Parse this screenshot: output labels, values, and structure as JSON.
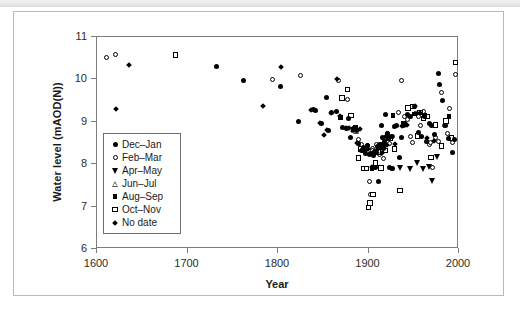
{
  "figure": {
    "frame_border_color": "#b9b9b9",
    "axis_color": "#7d7d7d",
    "marker_color": "#000000",
    "background": "#ffffff"
  },
  "chart_data": {
    "type": "scatter",
    "title": "",
    "xlabel": "Year",
    "ylabel": "Water level (mAOD(N))",
    "xlim": [
      1600,
      2000
    ],
    "ylim": [
      6,
      11
    ],
    "xticks": [
      1600,
      1700,
      1800,
      1900,
      2000
    ],
    "yticks": [
      6,
      7,
      8,
      9,
      10,
      11
    ],
    "grid": false,
    "legend_position": "inner-left",
    "legend": [
      {
        "label": "Dec–Jan",
        "marker": "circle-filled"
      },
      {
        "label": "Feb–Mar",
        "marker": "circle-open"
      },
      {
        "label": "Apr–May",
        "marker": "triangle-down-filled"
      },
      {
        "label": "Jun–Jul",
        "marker": "triangle-up-open"
      },
      {
        "label": "Aug–Sep",
        "marker": "square-filled"
      },
      {
        "label": "Oct–Nov",
        "marker": "square-open"
      },
      {
        "label": "No date",
        "marker": "diamond-filled"
      }
    ],
    "series": [
      {
        "name": "Dec–Jan",
        "marker": "circle-filled",
        "points": [
          [
            1733,
            10.27
          ],
          [
            1763,
            9.95
          ],
          [
            1804,
            9.82
          ],
          [
            1824,
            8.98
          ],
          [
            1840,
            9.26
          ],
          [
            1843,
            9.25
          ],
          [
            1849,
            8.94
          ],
          [
            1855,
            9.56
          ],
          [
            1857,
            8.78
          ],
          [
            1860,
            9.19
          ],
          [
            1866,
            9.21
          ],
          [
            1872,
            8.84
          ],
          [
            1877,
            8.82
          ],
          [
            1879,
            9.05
          ],
          [
            1881,
            8.6
          ],
          [
            1884,
            8.83
          ],
          [
            1886,
            8.8
          ],
          [
            1888,
            8.78
          ],
          [
            1890,
            8.46
          ],
          [
            1893,
            8.3
          ],
          [
            1896,
            8.36
          ],
          [
            1898,
            8.24
          ],
          [
            1900,
            8.42
          ],
          [
            1902,
            8.2
          ],
          [
            1903,
            8.22
          ],
          [
            1905,
            7.9
          ],
          [
            1906,
            7.89
          ],
          [
            1907,
            8.18
          ],
          [
            1908,
            8.28
          ],
          [
            1909,
            7.9
          ],
          [
            1910,
            8.25
          ],
          [
            1911,
            8.4
          ],
          [
            1912,
            7.58
          ],
          [
            1913,
            8.45
          ],
          [
            1914,
            8.36
          ],
          [
            1915,
            8.9
          ],
          [
            1916,
            8.44
          ],
          [
            1917,
            8.6
          ],
          [
            1918,
            8.34
          ],
          [
            1919,
            8.52
          ],
          [
            1920,
            9.16
          ],
          [
            1921,
            8.64
          ],
          [
            1922,
            8.7
          ],
          [
            1923,
            8.58
          ],
          [
            1924,
            7.9
          ],
          [
            1926,
            8.62
          ],
          [
            1928,
            7.88
          ],
          [
            1930,
            8.86
          ],
          [
            1932,
            8.9
          ],
          [
            1935,
            8.14
          ],
          [
            1938,
            8.6
          ],
          [
            1940,
            8.9
          ],
          [
            1944,
            9.14
          ],
          [
            1948,
            9.1
          ],
          [
            1952,
            9.34
          ],
          [
            1956,
            8.72
          ],
          [
            1960,
            8.64
          ],
          [
            1963,
            9.1
          ],
          [
            1965,
            8.52
          ],
          [
            1968,
            8.94
          ],
          [
            1971,
            8.88
          ],
          [
            1974,
            8.68
          ],
          [
            1978,
            10.12
          ],
          [
            1980,
            9.86
          ],
          [
            1983,
            9.49
          ],
          [
            1986,
            8.9
          ],
          [
            1990,
            8.58
          ],
          [
            1994,
            8.26
          ],
          [
            1996,
            8.56
          ]
        ]
      },
      {
        "name": "Feb–Mar",
        "marker": "circle-open",
        "points": [
          [
            1612,
            10.49
          ],
          [
            1622,
            10.56
          ],
          [
            1795,
            9.98
          ],
          [
            1826,
            10.06
          ],
          [
            1868,
            9.95
          ],
          [
            1872,
            9.54
          ],
          [
            1878,
            9.5
          ],
          [
            1884,
            8.8
          ],
          [
            1887,
            8.82
          ],
          [
            1890,
            8.56
          ],
          [
            1893,
            8.44
          ],
          [
            1895,
            8.3
          ],
          [
            1898,
            8.32
          ],
          [
            1900,
            8.42
          ],
          [
            1902,
            7.58
          ],
          [
            1903,
            7.27
          ],
          [
            1905,
            8.34
          ],
          [
            1906,
            8.3
          ],
          [
            1908,
            8.24
          ],
          [
            1910,
            8.44
          ],
          [
            1913,
            8.2
          ],
          [
            1916,
            8.28
          ],
          [
            1918,
            8.12
          ],
          [
            1920,
            8.6
          ],
          [
            1922,
            8.7
          ],
          [
            1924,
            8.46
          ],
          [
            1926,
            7.88
          ],
          [
            1928,
            8.62
          ],
          [
            1930,
            8.34
          ],
          [
            1934,
            9.2
          ],
          [
            1938,
            9.96
          ],
          [
            1941,
            9.1
          ],
          [
            1944,
            9.04
          ],
          [
            1947,
            8.62
          ],
          [
            1950,
            8.5
          ],
          [
            1953,
            9.18
          ],
          [
            1956,
            9.1
          ],
          [
            1959,
            8.88
          ],
          [
            1962,
            9.22
          ],
          [
            1965,
            9.1
          ],
          [
            1968,
            8.44
          ],
          [
            1970,
            8.5
          ],
          [
            1972,
            7.9
          ],
          [
            1975,
            8.6
          ],
          [
            1978,
            8.52
          ],
          [
            1982,
            9.66
          ],
          [
            1985,
            8.88
          ],
          [
            1988,
            8.7
          ],
          [
            1991,
            9.28
          ],
          [
            1994,
            8.5
          ],
          [
            1997,
            10.09
          ]
        ]
      },
      {
        "name": "Apr–May",
        "marker": "triangle-down-filled",
        "points": [
          [
            1920,
            8.4
          ],
          [
            1936,
            7.88
          ],
          [
            1948,
            7.86
          ],
          [
            1955,
            8.0
          ],
          [
            1962,
            7.86
          ],
          [
            1968,
            7.9
          ],
          [
            1972,
            7.57
          ],
          [
            1977,
            8.14
          ]
        ]
      },
      {
        "name": "Jun–Jul",
        "marker": "triangle-up-open",
        "points": [
          [
            1884,
            8.8
          ],
          [
            1886,
            8.78
          ],
          [
            1888,
            8.76
          ],
          [
            1894,
            8.34
          ]
        ]
      },
      {
        "name": "Aug–Sep",
        "marker": "square-filled",
        "points": [
          [
            1870,
            9.08
          ],
          [
            1884,
            8.8
          ],
          [
            1887,
            8.84
          ],
          [
            1905,
            7.88
          ],
          [
            1928,
            9.12
          ],
          [
            1941,
            8.92
          ],
          [
            1952,
            9.16
          ],
          [
            1963,
            9.12
          ],
          [
            1990,
            9.1
          ]
        ]
      },
      {
        "name": "Oct–Nov",
        "marker": "square-open",
        "points": [
          [
            1688,
            10.55
          ],
          [
            1872,
            9.54
          ],
          [
            1878,
            9.74
          ],
          [
            1882,
            9.12
          ],
          [
            1890,
            8.12
          ],
          [
            1893,
            8.34
          ],
          [
            1896,
            7.88
          ],
          [
            1899,
            7.88
          ],
          [
            1901,
            6.96
          ],
          [
            1903,
            7.06
          ],
          [
            1906,
            7.26
          ],
          [
            1909,
            8.0
          ],
          [
            1912,
            8.26
          ],
          [
            1915,
            7.89
          ],
          [
            1920,
            8.3
          ],
          [
            1925,
            8.6
          ],
          [
            1930,
            8.34
          ],
          [
            1936,
            7.36
          ],
          [
            1940,
            8.92
          ],
          [
            1945,
            9.3
          ],
          [
            1950,
            9.34
          ],
          [
            1955,
            8.64
          ],
          [
            1958,
            9.2
          ],
          [
            1962,
            9.06
          ],
          [
            1966,
            9.1
          ],
          [
            1970,
            8.14
          ],
          [
            1975,
            8.9
          ],
          [
            1982,
            8.4
          ],
          [
            1987,
            9.0
          ],
          [
            1993,
            8.6
          ],
          [
            1997,
            10.38
          ]
        ]
      },
      {
        "name": "No date",
        "marker": "diamond-filled",
        "points": [
          [
            1636,
            10.31
          ],
          [
            1622,
            9.27
          ],
          [
            1804,
            10.27
          ],
          [
            1785,
            9.36
          ],
          [
            1838,
            9.26
          ],
          [
            1848,
            8.94
          ],
          [
            1852,
            8.66
          ],
          [
            1855,
            8.78
          ],
          [
            1860,
            9.18
          ],
          [
            1866,
            9.98
          ],
          [
            1870,
            9.12
          ],
          [
            1876,
            8.84
          ],
          [
            1880,
            8.82
          ],
          [
            1884,
            8.8
          ],
          [
            1888,
            8.47
          ],
          [
            1892,
            8.8
          ],
          [
            1897,
            8.28
          ],
          [
            1900,
            8.34
          ],
          [
            1905,
            7.9
          ],
          [
            1910,
            8.3
          ],
          [
            1916,
            8.24
          ],
          [
            1922,
            8.44
          ],
          [
            1930,
            8.46
          ],
          [
            1938,
            8.88
          ],
          [
            1944,
            8.9
          ],
          [
            1952,
            9.34
          ],
          [
            1958,
            9.18
          ],
          [
            1966,
            8.6
          ],
          [
            1974,
            8.52
          ]
        ]
      }
    ]
  }
}
